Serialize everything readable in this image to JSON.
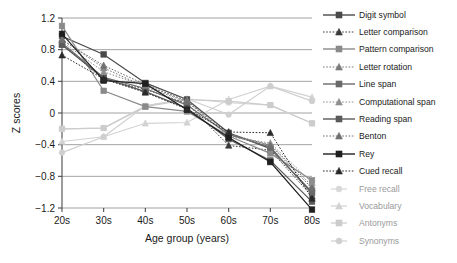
{
  "chart_data": {
    "type": "line",
    "title": "",
    "xlabel": "Age group (years)",
    "ylabel": "Z scores",
    "categories": [
      "20s",
      "30s",
      "40s",
      "50s",
      "60s",
      "70s",
      "80s"
    ],
    "ylim": [
      -1.2,
      1.2
    ],
    "yticks": [
      "1.2",
      "0.8",
      "0.4",
      "0",
      "-0.4",
      "-0.8",
      "-1.2"
    ],
    "ytick_values": [
      1.2,
      0.8,
      0.4,
      0,
      -0.4,
      -0.8,
      -1.2
    ],
    "grid": "horizontal",
    "legend_position": "right",
    "series": [
      {
        "name": "Digit symbol",
        "values": [
          0.97,
          0.74,
          0.38,
          0.17,
          -0.25,
          -0.45,
          -1.0
        ],
        "style": "solid",
        "marker": "square",
        "color": "#4a4a4a"
      },
      {
        "name": "Letter comparison",
        "values": [
          0.87,
          0.42,
          0.3,
          0.12,
          -0.41,
          -0.47,
          -1.05
        ],
        "style": "dotted",
        "marker": "triangle",
        "color": "#3a3a3a"
      },
      {
        "name": "Pattern comparison",
        "values": [
          1.1,
          0.28,
          0.08,
          0.02,
          -0.29,
          -0.51,
          -0.85
        ],
        "style": "solid",
        "marker": "square",
        "color": "#8a8a8a"
      },
      {
        "name": "Letter rotation",
        "values": [
          0.93,
          0.57,
          0.33,
          0.14,
          -0.28,
          -0.4,
          -0.92
        ],
        "style": "dotted",
        "marker": "triangle",
        "color": "#7a7a7a"
      },
      {
        "name": "Line span",
        "values": [
          0.88,
          0.45,
          0.31,
          0.1,
          -0.27,
          -0.43,
          -1.02
        ],
        "style": "solid",
        "marker": "square",
        "color": "#6a6a6a"
      },
      {
        "name": "Computational span",
        "values": [
          0.9,
          0.52,
          0.34,
          0.16,
          -0.3,
          -0.38,
          -0.88
        ],
        "style": "dotted",
        "marker": "triangle",
        "color": "#8f8f8f"
      },
      {
        "name": "Reading span",
        "values": [
          0.86,
          0.44,
          0.27,
          0.06,
          -0.33,
          -0.6,
          -1.12
        ],
        "style": "solid",
        "marker": "square",
        "color": "#5a5a5a"
      },
      {
        "name": "Benton",
        "values": [
          0.92,
          0.6,
          0.36,
          0.15,
          -0.26,
          -0.41,
          -0.95
        ],
        "style": "dotted",
        "marker": "triangle",
        "color": "#6f6f6f"
      },
      {
        "name": "Rey",
        "values": [
          1.0,
          0.41,
          0.37,
          0.04,
          -0.31,
          -0.62,
          -1.22
        ],
        "style": "solid",
        "marker": "square",
        "color": "#1f1f1f"
      },
      {
        "name": "Cued recall",
        "values": [
          0.73,
          0.43,
          0.26,
          0.05,
          -0.24,
          -0.25,
          -1.08
        ],
        "style": "dotted",
        "marker": "triangle",
        "color": "#2a2a2a"
      },
      {
        "name": "Free recall",
        "values": [
          -0.2,
          -0.19,
          0.09,
          0.18,
          0.13,
          0.1,
          -0.13
        ],
        "style": "solid",
        "marker": "circle",
        "color": "#d8d8d8"
      },
      {
        "name": "Vocabulary",
        "values": [
          -0.36,
          -0.3,
          -0.13,
          -0.12,
          0.17,
          0.34,
          0.2
        ],
        "style": "solid",
        "marker": "triangle",
        "color": "#d2d2d2"
      },
      {
        "name": "Antonyms",
        "values": [
          -0.2,
          -0.19,
          0.08,
          0.17,
          0.15,
          0.1,
          -0.13
        ],
        "style": "solid",
        "marker": "square",
        "color": "#cccccc"
      },
      {
        "name": "Synonyms",
        "values": [
          -0.5,
          -0.3,
          0.09,
          0.18,
          -0.02,
          0.34,
          0.15
        ],
        "style": "solid",
        "marker": "circle",
        "color": "#cfcfcf"
      }
    ]
  }
}
